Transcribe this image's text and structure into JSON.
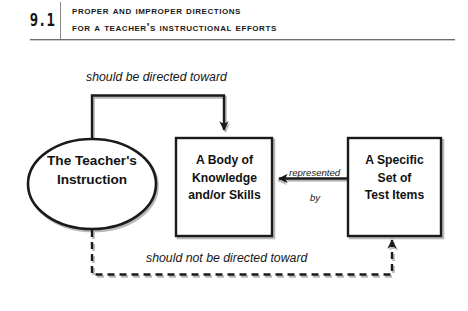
{
  "header": {
    "figure_number": "9.1",
    "title_line_1": "Proper and Improper Directions",
    "title_line_2": "for a Teacher's Instructional Efforts"
  },
  "diagram": {
    "type": "flow-diagram",
    "nodes": [
      {
        "id": "teacher-instruction",
        "shape": "ellipse",
        "label": "The Teacher's\nInstruction",
        "line_1": "The Teacher's",
        "line_2": "Instruction"
      },
      {
        "id": "body-of-knowledge",
        "shape": "rectangle",
        "label": "A Body of\nKnowledge\nand/or Skills",
        "line_1": "A Body of",
        "line_2": "Knowledge",
        "line_3": "and/or Skills"
      },
      {
        "id": "test-items",
        "shape": "rectangle",
        "label": "A Specific\nSet of\nTest Items",
        "line_1": "A Specific",
        "line_2": "Set of",
        "line_3": "Test Items"
      }
    ],
    "edges": [
      {
        "id": "proper-direction",
        "from": "teacher-instruction",
        "to": "body-of-knowledge",
        "label": "should be directed toward",
        "style": "solid",
        "routing": "up-over-down"
      },
      {
        "id": "representation",
        "from": "test-items",
        "to": "body-of-knowledge",
        "label_line_1": "represented",
        "label_line_2": "by",
        "style": "solid",
        "routing": "straight-horizontal"
      },
      {
        "id": "improper-direction",
        "from": "teacher-instruction",
        "to": "test-items",
        "label": "should not be directed toward",
        "style": "dashed",
        "routing": "down-over-up"
      }
    ]
  },
  "colors": {
    "stroke": "#1a1a1a",
    "shadow": "#b8b8b8",
    "text": "#121212",
    "rule": "#6d6d6d",
    "background": "#ffffff"
  }
}
